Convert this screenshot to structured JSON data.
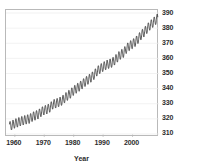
{
  "chart_data": {
    "type": "line",
    "title": "",
    "subtitle": "",
    "xlabel": "Year",
    "ylabel": "",
    "xlim": [
      1957.0,
      2009.0
    ],
    "ylim": [
      308.0,
      392.0
    ],
    "grid": "horizontal",
    "legend": "none",
    "y_axis_position": "right",
    "x_ticks": [
      1960,
      1970,
      1980,
      1990,
      2000
    ],
    "x_tick_labels": [
      "1960",
      "1970",
      "1980",
      "1990",
      "2000"
    ],
    "y_ticks": [
      310,
      320,
      330,
      340,
      350,
      360,
      370,
      380,
      390
    ],
    "y_tick_labels": [
      "310",
      "320",
      "330",
      "340",
      "350",
      "360",
      "370",
      "380",
      "390"
    ],
    "line_color": "#2e2e2e",
    "series": [
      {
        "name": "Atmospheric CO2 concentration",
        "annual_trend_x": [
          1958,
          1959,
          1960,
          1961,
          1962,
          1963,
          1964,
          1965,
          1966,
          1967,
          1968,
          1969,
          1970,
          1971,
          1972,
          1973,
          1974,
          1975,
          1976,
          1977,
          1978,
          1979,
          1980,
          1981,
          1982,
          1983,
          1984,
          1985,
          1986,
          1987,
          1988,
          1989,
          1990,
          1991,
          1992,
          1993,
          1994,
          1995,
          1996,
          1997,
          1998,
          1999,
          2000,
          2001,
          2002,
          2003,
          2004,
          2005,
          2006,
          2007,
          2008
        ],
        "annual_trend_y": [
          315.0,
          315.8,
          316.9,
          317.6,
          318.4,
          319.0,
          319.6,
          320.0,
          321.4,
          322.2,
          323.0,
          324.6,
          325.7,
          326.3,
          327.5,
          329.7,
          330.2,
          331.1,
          332.0,
          333.8,
          335.4,
          336.8,
          338.7,
          340.1,
          341.4,
          343.0,
          344.6,
          346.0,
          347.4,
          349.2,
          351.6,
          353.1,
          354.4,
          355.6,
          356.4,
          357.1,
          358.8,
          360.8,
          362.6,
          363.7,
          366.6,
          368.3,
          369.5,
          371.0,
          373.1,
          375.6,
          377.4,
          379.7,
          381.9,
          383.7,
          385.6
        ],
        "seasonal_amplitude": 6.0,
        "seasonal_peak_month": 5,
        "y_start": 315.0,
        "y_end": 388.5,
        "units": "ppm"
      }
    ]
  }
}
